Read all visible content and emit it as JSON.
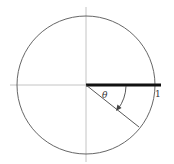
{
  "diagram": {
    "type": "unit-circle-angle",
    "labels": {
      "angle": "θ",
      "radius_value": "1"
    },
    "colors": {
      "circle": "#555555",
      "axes": "#b0b0b0",
      "bold_segment": "#111111",
      "radius_line": "#444444",
      "text": "#333333"
    },
    "elements": [
      "circle",
      "horizontal-axis",
      "vertical-axis",
      "bold-segment-positive-x",
      "rotated-radius",
      "angle-arc-arrow"
    ]
  }
}
